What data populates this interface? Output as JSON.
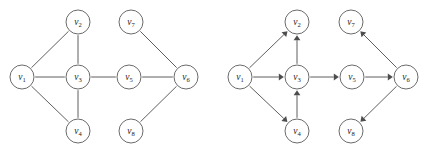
{
  "figure": {
    "background_color": "#ffffff",
    "stroke_color": "#4d4d4d",
    "node_fill": "#ffffff",
    "node_stroke": "#5a5a5a",
    "node_radius": 12,
    "label_color": "#1c1c1c"
  },
  "graphs": [
    {
      "id": "left-graph",
      "kind": "undirected",
      "nodes": [
        {
          "id": "v1",
          "label": "v",
          "sub": "1",
          "x": 22,
          "y": 77
        },
        {
          "id": "v2",
          "label": "v",
          "sub": "2",
          "x": 78,
          "y": 22
        },
        {
          "id": "v3",
          "label": "v",
          "sub": "3",
          "x": 78,
          "y": 77
        },
        {
          "id": "v4",
          "label": "v",
          "sub": "4",
          "x": 78,
          "y": 131
        },
        {
          "id": "v5",
          "label": "v",
          "sub": "5",
          "x": 129,
          "y": 77
        },
        {
          "id": "v6",
          "label": "v",
          "sub": "6",
          "x": 186,
          "y": 77
        },
        {
          "id": "v7",
          "label": "v",
          "sub": "7",
          "x": 131,
          "y": 22
        },
        {
          "id": "v8",
          "label": "v",
          "sub": "8",
          "x": 131,
          "y": 131
        }
      ],
      "edges": [
        {
          "from": "v1",
          "to": "v2"
        },
        {
          "from": "v1",
          "to": "v3"
        },
        {
          "from": "v1",
          "to": "v4"
        },
        {
          "from": "v2",
          "to": "v3"
        },
        {
          "from": "v3",
          "to": "v4"
        },
        {
          "from": "v3",
          "to": "v5"
        },
        {
          "from": "v5",
          "to": "v6"
        },
        {
          "from": "v6",
          "to": "v7"
        },
        {
          "from": "v6",
          "to": "v8"
        }
      ]
    },
    {
      "id": "right-graph",
      "kind": "directed",
      "nodes": [
        {
          "id": "v1",
          "label": "v",
          "sub": "1",
          "x": 240,
          "y": 77
        },
        {
          "id": "v2",
          "label": "v",
          "sub": "2",
          "x": 297,
          "y": 22
        },
        {
          "id": "v3",
          "label": "v",
          "sub": "3",
          "x": 297,
          "y": 77
        },
        {
          "id": "v4",
          "label": "v",
          "sub": "4",
          "x": 297,
          "y": 131
        },
        {
          "id": "v5",
          "label": "v",
          "sub": "5",
          "x": 352,
          "y": 77
        },
        {
          "id": "v6",
          "label": "v",
          "sub": "6",
          "x": 406,
          "y": 77
        },
        {
          "id": "v7",
          "label": "v",
          "sub": "7",
          "x": 351,
          "y": 22
        },
        {
          "id": "v8",
          "label": "v",
          "sub": "8",
          "x": 351,
          "y": 131
        }
      ],
      "edges": [
        {
          "from": "v1",
          "to": "v2"
        },
        {
          "from": "v1",
          "to": "v3"
        },
        {
          "from": "v1",
          "to": "v4"
        },
        {
          "from": "v3",
          "to": "v2"
        },
        {
          "from": "v4",
          "to": "v3"
        },
        {
          "from": "v3",
          "to": "v5"
        },
        {
          "from": "v5",
          "to": "v6"
        },
        {
          "from": "v6",
          "to": "v7"
        },
        {
          "from": "v6",
          "to": "v8"
        }
      ]
    }
  ]
}
